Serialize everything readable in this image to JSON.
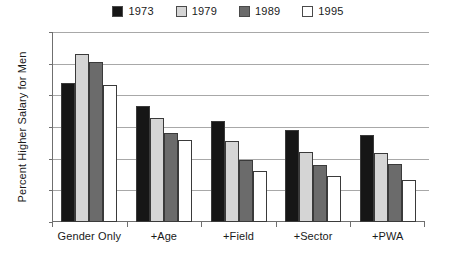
{
  "chart_data": {
    "type": "bar",
    "title": "",
    "subtitle": "",
    "xlabel": "",
    "ylabel": "Percent Higher Salary for Men",
    "categories": [
      "Gender Only",
      "+Age",
      "+Field",
      "+Sector",
      "+PWA"
    ],
    "series": [
      {
        "name": "1973",
        "color": "#161616",
        "values": [
          22.0,
          18.3,
          16.0,
          14.6,
          13.7
        ]
      },
      {
        "name": "1979",
        "color": "#d5d5d5",
        "values": [
          26.5,
          16.4,
          12.8,
          11.1,
          10.9
        ]
      },
      {
        "name": "1989",
        "color": "#6b6b6b",
        "values": [
          25.2,
          14.1,
          9.8,
          9.0,
          9.2
        ]
      },
      {
        "name": "1995",
        "color": "#ffffff",
        "values": [
          21.7,
          13.0,
          8.0,
          7.3,
          6.6
        ]
      }
    ],
    "ylim": [
      0,
      30
    ],
    "yticks": [
      0,
      5,
      10,
      15,
      20,
      25,
      30
    ],
    "ytick_labels": [
      "0",
      "5",
      "10",
      "15",
      "20",
      "25",
      "30"
    ],
    "grid": true,
    "grid_axis": "y",
    "legend_position": "top-center",
    "bar_edge_color": "#3a3a3a",
    "axis_color": "#6f6f6f",
    "grid_color": "#a8a8a8",
    "background": "#ffffff"
  }
}
